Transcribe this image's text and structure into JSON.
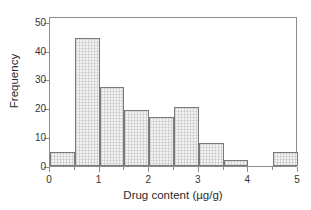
{
  "chart_data": {
    "type": "bar",
    "title": "",
    "subtitle": "",
    "xlabel": "Drug content (µg/g)",
    "ylabel": "Frequency",
    "xlim": [
      0,
      5
    ],
    "ylim": [
      0,
      52
    ],
    "grid": false,
    "legend": null,
    "bin_width": 0.5,
    "bin_edges": [
      0,
      0.5,
      1.0,
      1.5,
      2.0,
      2.5,
      3.0,
      3.5,
      4.0,
      4.5,
      5.0
    ],
    "categories": [
      "0-0.5",
      "0.5-1",
      "1-1.5",
      "1.5-2",
      "2-2.5",
      "2.5-3",
      "3-3.5",
      "3.5-4",
      "4-4.5",
      "4.5-5"
    ],
    "values": [
      5,
      44.5,
      27.5,
      19.5,
      17,
      20.5,
      8,
      2,
      0,
      5
    ],
    "xticks": [
      {
        "value": 0,
        "label": "0"
      },
      {
        "value": 1,
        "label": "1"
      },
      {
        "value": 2,
        "label": "2"
      },
      {
        "value": 3,
        "label": "3"
      },
      {
        "value": 4,
        "label": "4"
      },
      {
        "value": 5,
        "label": "5"
      }
    ],
    "xminor_ticks": [
      0.5,
      1.5,
      2.5,
      3.5,
      4.5
    ],
    "yticks": [
      {
        "value": 0,
        "label": "0"
      },
      {
        "value": 10,
        "label": "10"
      },
      {
        "value": 20,
        "label": "20"
      },
      {
        "value": 30,
        "label": "30"
      },
      {
        "value": 40,
        "label": "40"
      },
      {
        "value": 50,
        "label": "50"
      }
    ],
    "colors": {
      "bar_fill": "#f2f2f2",
      "bar_edge": "#7a7a7a",
      "axis": "#8d8d8d",
      "text": "#2b2b2b",
      "background": "#ffffff"
    }
  }
}
